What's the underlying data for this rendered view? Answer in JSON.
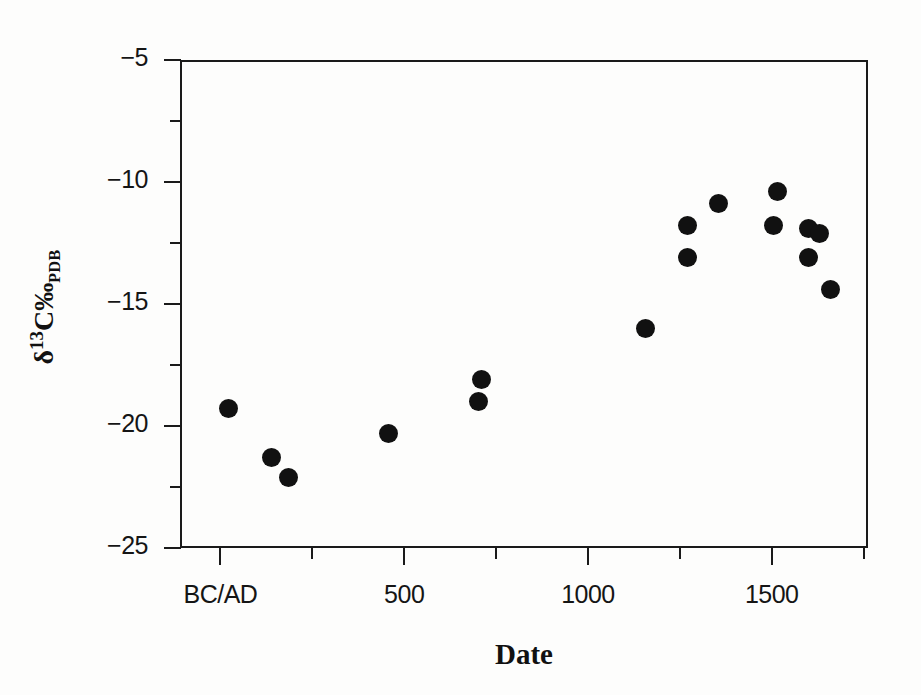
{
  "chart_data": {
    "type": "scatter",
    "title": "",
    "xlabel": "Date",
    "ylabel_parts": {
      "delta": "δ",
      "mass": "13",
      "element": "C",
      "permil": "‰",
      "standard": "PDB"
    },
    "ylabel_text": "δ13C‰ PDB",
    "xlim": [
      -110,
      1762
    ],
    "ylim": [
      -25,
      -5
    ],
    "grid": false,
    "legend": null,
    "x_ticks_major": [
      {
        "value": 0,
        "label": "BC/AD"
      },
      {
        "value": 500,
        "label": "500"
      },
      {
        "value": 1000,
        "label": "1000"
      },
      {
        "value": 1500,
        "label": "1500"
      }
    ],
    "x_ticks_minor": [
      250,
      750,
      1250,
      1750
    ],
    "y_ticks_major": [
      {
        "value": -5,
        "label": "−5"
      },
      {
        "value": -10,
        "label": "−10"
      },
      {
        "value": -15,
        "label": "−15"
      },
      {
        "value": -20,
        "label": "−20"
      },
      {
        "value": -25,
        "label": "−25"
      }
    ],
    "y_ticks_minor": [
      -7.5,
      -12.5,
      -17.5,
      -22.5
    ],
    "marker": {
      "shape": "circle",
      "color": "#111111",
      "size_px": 19
    },
    "points": [
      {
        "x": 23,
        "y": -19.3
      },
      {
        "x": 138,
        "y": -21.3
      },
      {
        "x": 185,
        "y": -22.1
      },
      {
        "x": 458,
        "y": -20.3
      },
      {
        "x": 710,
        "y": -18.1
      },
      {
        "x": 703,
        "y": -19.0
      },
      {
        "x": 1156,
        "y": -16.0
      },
      {
        "x": 1271,
        "y": -11.8
      },
      {
        "x": 1271,
        "y": -13.1
      },
      {
        "x": 1354,
        "y": -10.9
      },
      {
        "x": 1515,
        "y": -10.4
      },
      {
        "x": 1505,
        "y": -11.8
      },
      {
        "x": 1599,
        "y": -11.9
      },
      {
        "x": 1630,
        "y": -12.1
      },
      {
        "x": 1599,
        "y": -13.1
      },
      {
        "x": 1661,
        "y": -14.4
      }
    ]
  }
}
